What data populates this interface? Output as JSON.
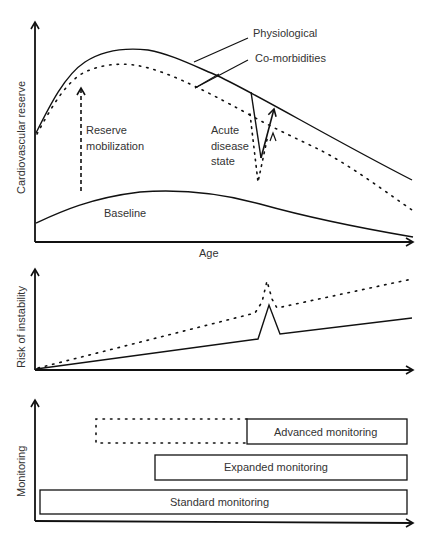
{
  "panels": {
    "reserve": {
      "ylabel": "Cardiovascular reserve",
      "xlabel": "Age",
      "labels": {
        "physiological": "Physiological",
        "comorbidities": "Co-morbidities",
        "reserve1": "Reserve",
        "reserve2": "mobilization",
        "acute1": "Acute",
        "acute2": "disease",
        "acute3": "state",
        "baseline": "Baseline"
      }
    },
    "risk": {
      "ylabel": "Risk of instability"
    },
    "monitoring": {
      "ylabel": "Monitoring",
      "bars": {
        "advanced": "Advanced  monitoring",
        "expanded": "Expanded monitoring",
        "standard": "Standard monitoring"
      }
    }
  },
  "colors": {
    "line": "#111111",
    "text": "#333333"
  }
}
